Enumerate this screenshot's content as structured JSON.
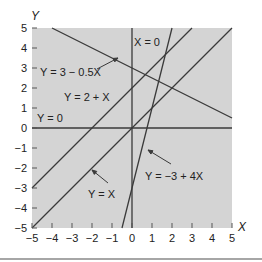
{
  "chart_data": {
    "type": "line",
    "title": "",
    "xlabel": "X",
    "ylabel": "Y",
    "xlim": [
      -5,
      5
    ],
    "ylim": [
      -5,
      5
    ],
    "grid": false,
    "background": "#d4d4d4",
    "x_ticks": [
      "-5",
      "-4",
      "-3",
      "-2",
      "-1",
      "0",
      "1",
      "2",
      "3",
      "4",
      "5"
    ],
    "y_ticks": [
      "5",
      "4",
      "3",
      "2",
      "1",
      "0",
      "-1",
      "-2",
      "-3",
      "-4",
      "-5"
    ],
    "series": [
      {
        "name": "Y = 3 - 0.5X",
        "intercept": 3,
        "slope": -0.5,
        "label": "Y = 3 − 0.5X"
      },
      {
        "name": "Y = 2 + X",
        "intercept": 2,
        "slope": 1,
        "label": "Y = 2 + X"
      },
      {
        "name": "Y = 0",
        "intercept": 0,
        "slope": 0,
        "label": "Y = 0"
      },
      {
        "name": "Y = X",
        "intercept": 0,
        "slope": 1,
        "label": "Y = X"
      },
      {
        "name": "Y = -3 + 4X",
        "intercept": -3,
        "slope": 4,
        "label": "Y = −3 + 4X"
      },
      {
        "name": "X = 0",
        "vertical_at": 0,
        "label": "X = 0"
      }
    ]
  }
}
